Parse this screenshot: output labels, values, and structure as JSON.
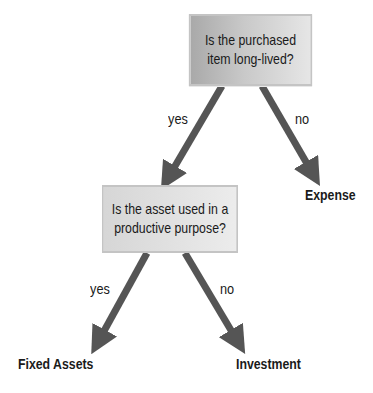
{
  "diagram": {
    "type": "decision-tree",
    "colors": {
      "arrow": "#555555",
      "box_border": "#c4c4c4",
      "text": "#1a1a1a"
    },
    "nodes": {
      "q1": {
        "text_line1": "Is the purchased",
        "text_line2": "item long-lived?"
      },
      "q2": {
        "text_line1": "Is the asset used in a",
        "text_line2": "productive purpose?"
      },
      "expense": {
        "label": "Expense"
      },
      "fixed_assets": {
        "label": "Fixed Assets"
      },
      "investment": {
        "label": "Investment"
      }
    },
    "edges": {
      "q1_yes": {
        "label": "yes",
        "from": "q1",
        "to": "q2"
      },
      "q1_no": {
        "label": "no",
        "from": "q1",
        "to": "expense"
      },
      "q2_yes": {
        "label": "yes",
        "from": "q2",
        "to": "fixed_assets"
      },
      "q2_no": {
        "label": "no",
        "from": "q2",
        "to": "investment"
      }
    }
  }
}
